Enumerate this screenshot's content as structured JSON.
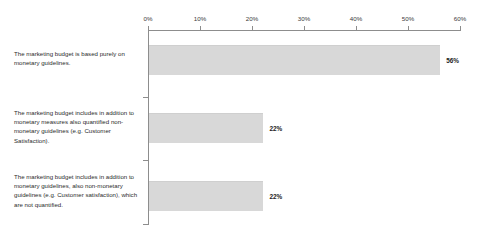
{
  "chart_data": {
    "type": "bar",
    "orientation": "horizontal",
    "title": "",
    "xlabel": "",
    "ylabel": "",
    "xlim": [
      0,
      60
    ],
    "grid": false,
    "legend": null,
    "tick_labels": [
      "0%",
      "10%",
      "20%",
      "30%",
      "40%",
      "50%",
      "60%"
    ],
    "tick_values": [
      0,
      10,
      20,
      30,
      40,
      50,
      60
    ],
    "categories": [
      "The marketing budget is based purely on monetary guidelines.",
      "The marketing budget includes in addition to monetary measures also quantified non-monetary guidelines (e.g. Customer Satisfaction).",
      "The marketing budget includes in addition to monetary guidelines, also non-monetary guidelines (e.g. Customer satisfaction), which are not quantified."
    ],
    "values": [
      56,
      22,
      22
    ],
    "value_labels": [
      "56%",
      "22%",
      "22%"
    ],
    "colors": {
      "bar_fill": "#d8d8d8",
      "bar_edge": "#cfcfcf",
      "axis": "#8d8d8d",
      "text": "#2b2b2b"
    }
  }
}
